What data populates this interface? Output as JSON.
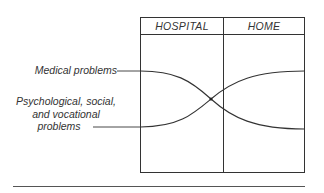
{
  "diagram": {
    "columns": [
      {
        "label": "HOSPITAL"
      },
      {
        "label": "HOME"
      }
    ],
    "series": [
      {
        "name": "Medical problems",
        "label": "Medical problems",
        "trend": "high in hospital, declining to low at home"
      },
      {
        "name": "Psychological, social, and vocational problems",
        "label_lines": [
          "Psychological, social,",
          "and vocational",
          "problems"
        ],
        "trend": "low in hospital, rising to high at home"
      }
    ],
    "colors": {
      "line": "#333333",
      "text": "#333333",
      "background": "#ffffff"
    }
  }
}
